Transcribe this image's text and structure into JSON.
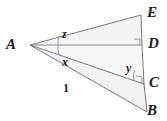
{
  "figure": {
    "type": "geometry-diagram",
    "background_color": "#fdfdfd",
    "stroke_color": "#7a7a7a",
    "label_color": "#1b1b1b"
  },
  "vertices": [
    {
      "id": "A",
      "label": "A",
      "x": 30,
      "y": 45,
      "label_x": 6,
      "label_y": 37
    },
    {
      "id": "E",
      "label": "E",
      "x": 141,
      "y": 15,
      "label_x": 147,
      "label_y": 5
    },
    {
      "id": "D",
      "label": "D",
      "x": 142,
      "y": 45,
      "label_x": 148,
      "label_y": 36
    },
    {
      "id": "C",
      "label": "C",
      "x": 144,
      "y": 84,
      "label_x": 149,
      "label_y": 75
    },
    {
      "id": "B",
      "label": "B",
      "x": 147,
      "y": 112,
      "label_x": 147,
      "label_y": 103
    }
  ],
  "angle_labels": [
    {
      "id": "z",
      "label": "z",
      "x": 62,
      "y": 28,
      "at_vertex": "A",
      "between": "AE-AD"
    },
    {
      "id": "x",
      "label": "x",
      "x": 62,
      "y": 56,
      "at_vertex": "A",
      "between": "AD-AC"
    },
    {
      "id": "y",
      "label": "y",
      "x": 126,
      "y": 62,
      "at_vertex": "C",
      "between": "CA-CD"
    }
  ],
  "segment_labels": [
    {
      "id": "AB-length",
      "label": "1",
      "x": 63,
      "y": 82,
      "on_segment": "AB"
    }
  ],
  "right_angle_marks": [
    {
      "id": "right-angle-D",
      "at_vertex": "D"
    },
    {
      "id": "right-angle-C",
      "at_vertex": "C"
    }
  ],
  "segments": [
    {
      "id": "AE",
      "from": "A",
      "to": "E"
    },
    {
      "id": "AD",
      "from": "A",
      "to": "D"
    },
    {
      "id": "AC",
      "from": "A",
      "to": "C"
    },
    {
      "id": "AB",
      "from": "A",
      "to": "B"
    },
    {
      "id": "ED",
      "from": "E",
      "to": "D"
    },
    {
      "id": "DC",
      "from": "D",
      "to": "C"
    },
    {
      "id": "CB",
      "from": "C",
      "to": "B"
    }
  ]
}
